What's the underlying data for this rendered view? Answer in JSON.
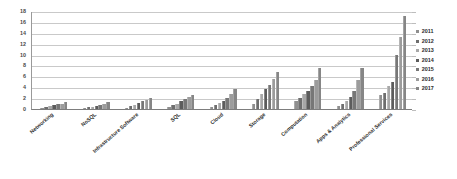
{
  "chart_data": {
    "type": "bar",
    "title": "",
    "xlabel": "",
    "ylabel": "",
    "ylim": [
      0,
      18
    ],
    "yticks": [
      0,
      2,
      4,
      6,
      8,
      10,
      12,
      14,
      16,
      18
    ],
    "grid": true,
    "legend_position": "right",
    "categories": [
      "Networking",
      "NoSQL",
      "Infrastructure Software",
      "SQL",
      "Cloud",
      "Storage",
      "Computation",
      "Apps & Analytics",
      "Professional Services"
    ],
    "series": [
      {
        "name": "2011",
        "color": "#8f8f8f",
        "values": [
          0.2,
          0.15,
          0.25,
          0.4,
          0.4,
          1.0,
          1.5,
          0.6,
          2.5
        ]
      },
      {
        "name": "2012",
        "color": "#6e6e6e",
        "values": [
          0.35,
          0.3,
          0.5,
          0.7,
          0.7,
          1.9,
          2.1,
          0.9,
          3.0
        ]
      },
      {
        "name": "2013",
        "color": "#a8a8a8",
        "values": [
          0.5,
          0.45,
          0.8,
          1.0,
          1.1,
          2.8,
          2.7,
          1.5,
          4.2
        ]
      },
      {
        "name": "2014",
        "color": "#5c5c5c",
        "values": [
          0.65,
          0.6,
          1.1,
          1.4,
          1.5,
          3.6,
          3.4,
          2.2,
          5.0
        ]
      },
      {
        "name": "2015",
        "color": "#777777",
        "values": [
          0.85,
          0.8,
          1.4,
          1.8,
          2.0,
          4.5,
          4.2,
          3.3,
          10.0
        ]
      },
      {
        "name": "2016",
        "color": "#9c9c9c",
        "values": [
          1.0,
          1.0,
          1.7,
          2.2,
          2.7,
          5.6,
          5.3,
          5.3,
          13.3
        ]
      },
      {
        "name": "2017",
        "color": "#868686",
        "values": [
          1.2,
          1.2,
          2.0,
          2.6,
          3.6,
          6.8,
          7.5,
          7.6,
          17.0
        ]
      }
    ]
  },
  "legend": {
    "entries": [
      "2011",
      "2012",
      "2013",
      "2014",
      "2015",
      "2016",
      "2017"
    ]
  }
}
